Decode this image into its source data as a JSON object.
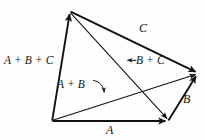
{
  "figure": {
    "background_color": "#fefefe",
    "ink_color": "#111111",
    "labels": {
      "sum_abc": "A + B + C",
      "sum_ab": "A + B",
      "sum_bc": "B + C",
      "bc_arrow_glyph": "←",
      "vector_c": "C",
      "vector_b": "B",
      "vector_a": "A"
    },
    "vertices": {
      "top": {
        "name": "T",
        "x": 70,
        "y": 11
      },
      "bottom_left": {
        "name": "L",
        "x": 52,
        "y": 121
      },
      "bottom_right": {
        "name": "R",
        "x": 168,
        "y": 121
      },
      "right": {
        "name": "E",
        "x": 198,
        "y": 73
      }
    },
    "vectors": [
      {
        "name": "A",
        "label": "A",
        "from": "bottom_left",
        "to": "bottom_right",
        "weight": "thick",
        "arrowhead": true
      },
      {
        "name": "B",
        "label": "B",
        "from": "bottom_right",
        "to": "right",
        "weight": "thick",
        "arrowhead": true
      },
      {
        "name": "C",
        "label": "C",
        "from": "top",
        "to": "right",
        "weight": "thick",
        "arrowhead": true
      },
      {
        "name": "A+B",
        "label": "A + B",
        "from": "bottom_left",
        "to": "right",
        "weight": "thin",
        "arrowhead": true
      },
      {
        "name": "B+C",
        "label": "B + C",
        "from": "top",
        "to": "bottom_right",
        "weight": "thin",
        "arrowhead": true
      },
      {
        "name": "A+B+C",
        "label": "A + B + C",
        "from": "bottom_left",
        "to": "top",
        "weight": "thick",
        "arrowhead": true
      }
    ],
    "pointers": [
      {
        "name": "ab-curved-pointer",
        "from_label": "A + B",
        "to_vector": "A+B",
        "style": "curved-arrow"
      },
      {
        "name": "bc-left-arrow",
        "from_label": "B + C",
        "to_vector": "B+C",
        "style": "straight-left-arrow"
      }
    ]
  }
}
